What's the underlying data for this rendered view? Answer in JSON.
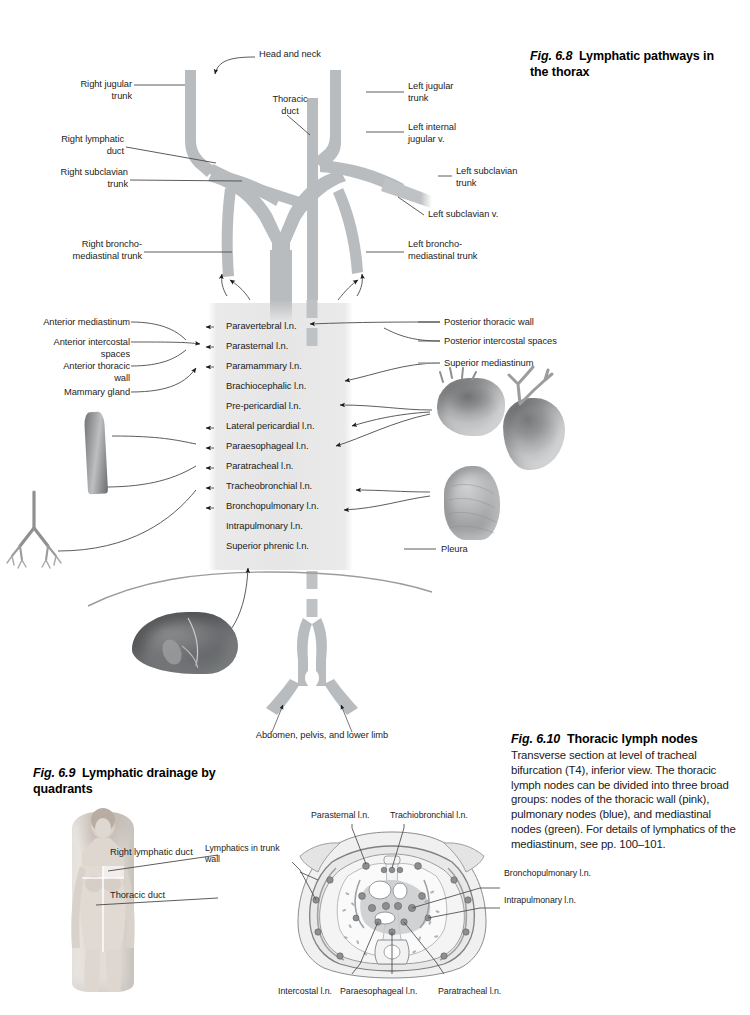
{
  "figures": {
    "fig68": {
      "number": "Fig. 6.8",
      "title": "Lymphatic pathways in the thorax",
      "labels": {
        "head_and_neck": "Head and neck",
        "right_jugular_trunk": "Right jugular\ntrunk",
        "thoracic_duct": "Thoracic\nduct",
        "left_jugular_trunk": "Left jugular\ntrunk",
        "left_internal_jugular_v": "Left internal\njugular v.",
        "right_lymphatic_duct": "Right lymphatic\nduct",
        "right_subclavian_trunk": "Right subclavian\ntrunk",
        "left_subclavian_trunk": "Left subclavian\ntrunk",
        "left_subclavian_v": "Left subclavian v.",
        "right_bronchomediastinal_trunk": "Right broncho-\nmediastinal trunk",
        "left_bronchomediastinal_trunk": "Left broncho-\nmediastinal trunk",
        "abdomen_pelvis_lower_limb": "Abdomen, pelvis, and lower limb"
      },
      "left_labels": [
        "Anterior mediastinum",
        "Anterior intercostal\nspaces",
        "Anterior thoracic\nwall",
        "Mammary gland"
      ],
      "right_labels": [
        "Posterior thoracic wall",
        "Posterior intercostal spaces",
        "Superior mediastinum",
        "Pleura"
      ],
      "nodes": [
        "Paravertebral l.n.",
        "Parasternal l.n.",
        "Paramammary l.n.",
        "Brachiocephalic l.n.",
        "Pre-pericardial l.n.",
        "Lateral pericardial l.n.",
        "Paraesophageal l.n.",
        "Paratracheal l.n.",
        "Tracheobronchial l.n.",
        "Bronchopulmonary l.n.",
        "Intrapulmonary l.n.",
        "Superior phrenic l.n."
      ]
    },
    "fig69": {
      "number": "Fig. 6.9",
      "title": "Lymphatic drainage by quadrants",
      "labels": {
        "right_lymphatic_duct": "Right lymphatic duct",
        "thoracic_duct": "Thoracic duct"
      }
    },
    "fig610": {
      "number": "Fig. 6.10",
      "title": "Thoracic lymph nodes",
      "caption": "Transverse section at level of tracheal bifurcation (T4), inferior view. The thoracic lymph nodes can be divided into three broad groups: nodes of the thoracic wall (pink), pulmonary nodes (blue), and mediastinal nodes (green). For details of lymphatics of the mediastinum, see pp. 100–101.",
      "labels": {
        "parasternal": "Parasternal l.n.",
        "trachiobronchial": "Trachiobronchial l.n.",
        "lymphatics_trunk_wall": "Lymphatics in\ntrunk wall",
        "bronchopulmonary": "Bronchopulmonary l.n.",
        "intrapulmonary": "Intrapulmonary l.n.",
        "intercostal": "Intercostal l.n.",
        "paraesophageal": "Paraesophageal l.n.",
        "paratracheal": "Paratracheal l.n."
      }
    }
  },
  "colors": {
    "vessel": "#b9bcbe",
    "leader": "#4a4a4a",
    "band": "#e9e9e9",
    "text": "#1d1d1d"
  }
}
